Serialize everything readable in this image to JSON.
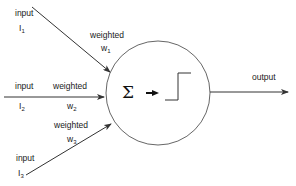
{
  "diagram": {
    "type": "perceptron",
    "inputs": [
      {
        "label": "input",
        "symbol": "I",
        "index": "1",
        "weight_label": "weighted",
        "weight_symbol": "w",
        "weight_index": "1"
      },
      {
        "label": "input",
        "symbol": "I",
        "index": "2",
        "weight_label": "weighted",
        "weight_symbol": "w",
        "weight_index": "2"
      },
      {
        "label": "input",
        "symbol": "I",
        "index": "3",
        "weight_label": "weighted",
        "weight_symbol": "w",
        "weight_index": "3"
      }
    ],
    "neuron": {
      "sum_symbol": "Σ",
      "activation": "step-function"
    },
    "output": {
      "label": "output"
    },
    "colors": {
      "stroke": "#333333",
      "text": "#1a1a1a"
    }
  }
}
